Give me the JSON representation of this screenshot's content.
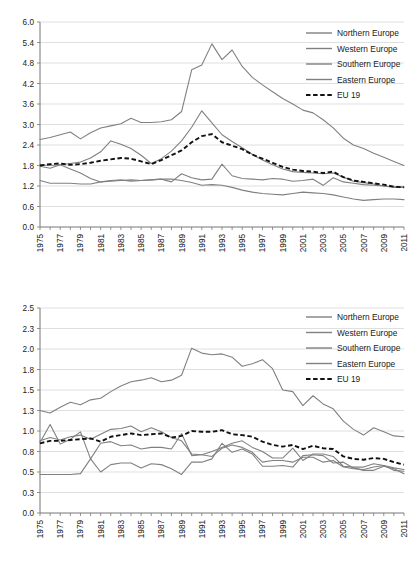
{
  "figure": {
    "panels": [
      "top-chart",
      "bottom-chart"
    ]
  },
  "chart_data": [
    {
      "id": "top-chart",
      "type": "line",
      "title": "",
      "subtitle": "",
      "xlabel": "",
      "ylabel": "",
      "grid": true,
      "legend_position": "top-right",
      "xlim": [
        1975,
        2011
      ],
      "ylim": [
        0.0,
        6.0
      ],
      "ytick_labels": [
        "0.0",
        "0.6",
        "1.2",
        "1.8",
        "2.4",
        "3.0",
        "3.6",
        "4.2",
        "4.8",
        "5.4",
        "6.0"
      ],
      "ytick_values": [
        0.0,
        0.6,
        1.2,
        1.8,
        2.4,
        3.0,
        3.6,
        4.2,
        4.8,
        5.4,
        6.0
      ],
      "x": [
        1975,
        1976,
        1977,
        1978,
        1979,
        1980,
        1981,
        1982,
        1983,
        1984,
        1985,
        1986,
        1987,
        1988,
        1989,
        1990,
        1991,
        1992,
        1993,
        1994,
        1995,
        1996,
        1997,
        1998,
        1999,
        2000,
        2001,
        2002,
        2003,
        2004,
        2005,
        2006,
        2007,
        2008,
        2009,
        2010,
        2011
      ],
      "xtick_labels": [
        "1975",
        "1977",
        "1979",
        "1981",
        "1983",
        "1985",
        "1987",
        "1989",
        "1991",
        "1993",
        "1995",
        "1997",
        "1999",
        "2001",
        "2003",
        "2005",
        "2007",
        "2009",
        "2011"
      ],
      "series": [
        {
          "name": "Northern Europe",
          "style": "solid",
          "values": [
            1.78,
            1.72,
            1.82,
            1.86,
            1.9,
            2.02,
            2.2,
            2.52,
            2.42,
            2.3,
            2.1,
            1.86,
            2.0,
            2.22,
            2.52,
            2.92,
            3.4,
            3.05,
            2.7,
            2.5,
            2.32,
            2.12,
            1.96,
            1.82,
            1.7,
            1.62,
            1.6,
            1.58,
            1.56,
            1.58,
            1.46,
            1.34,
            1.3,
            1.26,
            1.2,
            1.16,
            1.16
          ]
        },
        {
          "name": "Western Europe",
          "style": "solid",
          "values": [
            2.56,
            2.62,
            2.7,
            2.78,
            2.58,
            2.76,
            2.9,
            2.96,
            3.02,
            3.18,
            3.06,
            3.06,
            3.08,
            3.14,
            3.38,
            4.6,
            4.74,
            5.36,
            4.9,
            5.18,
            4.7,
            4.38,
            4.16,
            3.96,
            3.76,
            3.6,
            3.42,
            3.34,
            3.14,
            2.9,
            2.6,
            2.4,
            2.3,
            2.16,
            2.04,
            1.92,
            1.8
          ]
        },
        {
          "name": "Southern Europe",
          "style": "solid",
          "values": [
            1.82,
            1.8,
            1.82,
            1.7,
            1.58,
            1.42,
            1.32,
            1.34,
            1.36,
            1.38,
            1.36,
            1.38,
            1.4,
            1.4,
            1.36,
            1.3,
            1.22,
            1.24,
            1.22,
            1.16,
            1.08,
            1.02,
            0.98,
            0.96,
            0.94,
            0.98,
            1.02,
            1.0,
            0.98,
            0.94,
            0.88,
            0.82,
            0.78,
            0.8,
            0.82,
            0.82,
            0.8
          ]
        },
        {
          "name": "Eastern Europe",
          "style": "solid",
          "values": [
            1.36,
            1.28,
            1.28,
            1.28,
            1.26,
            1.26,
            1.32,
            1.36,
            1.38,
            1.34,
            1.36,
            1.38,
            1.4,
            1.32,
            1.56,
            1.44,
            1.38,
            1.4,
            1.84,
            1.5,
            1.42,
            1.4,
            1.38,
            1.42,
            1.4,
            1.34,
            1.36,
            1.4,
            1.22,
            1.44,
            1.32,
            1.28,
            1.24,
            1.22,
            1.2,
            1.18,
            1.18
          ]
        },
        {
          "name": "EU 19",
          "style": "dashed",
          "values": [
            1.8,
            1.84,
            1.86,
            1.82,
            1.84,
            1.88,
            1.94,
            1.98,
            2.02,
            2.0,
            1.92,
            1.84,
            1.96,
            2.1,
            2.24,
            2.48,
            2.66,
            2.72,
            2.48,
            2.38,
            2.28,
            2.12,
            2.0,
            1.88,
            1.76,
            1.68,
            1.64,
            1.62,
            1.58,
            1.62,
            1.46,
            1.36,
            1.32,
            1.28,
            1.24,
            1.18,
            1.16
          ]
        }
      ]
    },
    {
      "id": "bottom-chart",
      "type": "line",
      "title": "",
      "subtitle": "",
      "xlabel": "",
      "ylabel": "",
      "grid": true,
      "legend_position": "top-right",
      "xlim": [
        1975,
        2011
      ],
      "ylim": [
        0.0,
        2.5
      ],
      "ytick_labels": [
        "0.0",
        "0.3",
        "0.5",
        "0.8",
        "1.0",
        "1.3",
        "1.5",
        "1.8",
        "2.0",
        "2.3",
        "2.5"
      ],
      "ytick_values": [
        0.0,
        0.25,
        0.5,
        0.75,
        1.0,
        1.25,
        1.5,
        1.75,
        2.0,
        2.25,
        2.5
      ],
      "x": [
        1975,
        1976,
        1977,
        1978,
        1979,
        1980,
        1981,
        1982,
        1983,
        1984,
        1985,
        1986,
        1987,
        1988,
        1989,
        1990,
        1991,
        1992,
        1993,
        1994,
        1995,
        1996,
        1997,
        1998,
        1999,
        2000,
        2001,
        2002,
        2003,
        2004,
        2005,
        2006,
        2007,
        2008,
        2009,
        2010,
        2011
      ],
      "xtick_labels": [
        "1975",
        "1977",
        "1979",
        "1981",
        "1983",
        "1985",
        "1987",
        "1989",
        "1991",
        "1993",
        "1995",
        "1997",
        "1999",
        "2001",
        "2003",
        "2005",
        "2007",
        "2009",
        "2011"
      ],
      "series": [
        {
          "name": "Northern Europe",
          "style": "solid",
          "values": [
            0.86,
            1.08,
            0.84,
            0.9,
            0.99,
            0.66,
            0.85,
            0.87,
            0.82,
            0.83,
            0.78,
            0.8,
            0.8,
            0.78,
            0.97,
            0.7,
            0.71,
            0.75,
            0.8,
            0.85,
            0.88,
            0.8,
            0.75,
            0.67,
            0.67,
            0.79,
            0.64,
            0.72,
            0.72,
            0.69,
            0.57,
            0.56,
            0.56,
            0.6,
            0.58,
            0.52,
            0.51
          ]
        },
        {
          "name": "Western Europe",
          "style": "solid",
          "values": [
            0.88,
            0.92,
            0.89,
            0.93,
            0.95,
            0.9,
            0.96,
            1.02,
            1.03,
            1.06,
            0.99,
            1.04,
            0.99,
            0.92,
            0.88,
            0.72,
            0.71,
            0.69,
            0.79,
            0.83,
            0.8,
            0.74,
            0.62,
            0.64,
            0.64,
            0.62,
            0.68,
            0.68,
            0.62,
            0.64,
            0.56,
            0.54,
            0.53,
            0.56,
            0.58,
            0.55,
            0.53
          ]
        },
        {
          "name": "Southern Europe",
          "style": "solid",
          "values": [
            1.25,
            1.22,
            1.29,
            1.35,
            1.32,
            1.38,
            1.4,
            1.48,
            1.55,
            1.6,
            1.62,
            1.65,
            1.6,
            1.62,
            1.68,
            2.01,
            1.95,
            1.93,
            1.94,
            1.9,
            1.79,
            1.82,
            1.87,
            1.76,
            1.5,
            1.48,
            1.31,
            1.43,
            1.33,
            1.27,
            1.12,
            1.02,
            0.95,
            1.04,
            0.99,
            0.94,
            0.93
          ]
        },
        {
          "name": "Eastern Europe",
          "style": "solid",
          "values": [
            0.47,
            0.47,
            0.47,
            0.47,
            0.48,
            0.66,
            0.5,
            0.59,
            0.61,
            0.61,
            0.55,
            0.6,
            0.59,
            0.54,
            0.47,
            0.62,
            0.62,
            0.66,
            0.85,
            0.74,
            0.78,
            0.72,
            0.57,
            0.57,
            0.58,
            0.56,
            0.7,
            0.71,
            0.7,
            0.61,
            0.62,
            0.55,
            0.52,
            0.52,
            0.57,
            0.54,
            0.48
          ]
        },
        {
          "name": "EU 19",
          "style": "dashed",
          "values": [
            0.85,
            0.88,
            0.88,
            0.89,
            0.9,
            0.91,
            0.87,
            0.93,
            0.95,
            0.97,
            0.95,
            0.96,
            0.97,
            0.92,
            0.94,
            1.0,
            0.99,
            0.99,
            1.01,
            0.96,
            0.95,
            0.93,
            0.87,
            0.83,
            0.81,
            0.83,
            0.78,
            0.82,
            0.79,
            0.78,
            0.69,
            0.66,
            0.65,
            0.67,
            0.66,
            0.62,
            0.59
          ]
        }
      ]
    }
  ],
  "legend": {
    "entries": [
      {
        "label": "Northern Europe",
        "style": "solid"
      },
      {
        "label": "Western Europe",
        "style": "solid"
      },
      {
        "label": "Southern Europe",
        "style": "solid"
      },
      {
        "label": "Eastern Europe",
        "style": "solid"
      },
      {
        "label": "EU 19",
        "style": "dashed"
      }
    ]
  },
  "colors": {
    "series_line": "#808080",
    "eu_line": "#111111",
    "gridline": "#c9c9c9",
    "axis": "#777777",
    "text": "#222222",
    "background": "#ffffff"
  }
}
